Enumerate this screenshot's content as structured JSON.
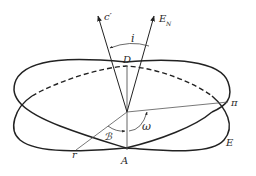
{
  "figure": {
    "type": "orbital-elements-diagram",
    "labels": {
      "c_prime": "c′",
      "E_N": "E",
      "E_N_sub": "N",
      "inclination": "i",
      "node_D": "D",
      "node_A": "A",
      "pericenter": "π",
      "omega": "ω",
      "node_longitude": "ℬ",
      "vernal_point": "r",
      "reference_plane": "E"
    },
    "colors": {
      "stroke": "#222222",
      "thin": "#555555",
      "background": "#ffffff"
    }
  }
}
